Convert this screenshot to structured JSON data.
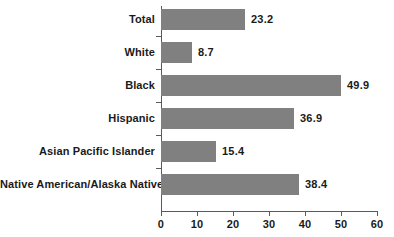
{
  "chart_data": {
    "type": "bar",
    "orientation": "horizontal",
    "title": "",
    "subtitle": "",
    "xlabel": "",
    "ylabel": "",
    "categories": [
      "Total",
      "White",
      "Black",
      "Hispanic",
      "Asian Pacific Islander",
      "Native American/Alaska Native"
    ],
    "values": [
      23.2,
      8.7,
      49.9,
      36.9,
      15.4,
      38.4
    ],
    "data_labels": [
      "23.2",
      "8.7",
      "49.9",
      "36.9",
      "15.4",
      "38.4"
    ],
    "xlim": [
      0,
      60
    ],
    "xticks": [
      0,
      10,
      20,
      30,
      40,
      50,
      60
    ],
    "xtick_labels": [
      "0",
      "10",
      "20",
      "30",
      "40",
      "50",
      "60"
    ],
    "grid": false,
    "legend": null,
    "legend_position": "none",
    "bar_color": "#808080",
    "axis_color": "#5a5a5a",
    "text_color": "#1a1a1a",
    "background": "#ffffff"
  }
}
